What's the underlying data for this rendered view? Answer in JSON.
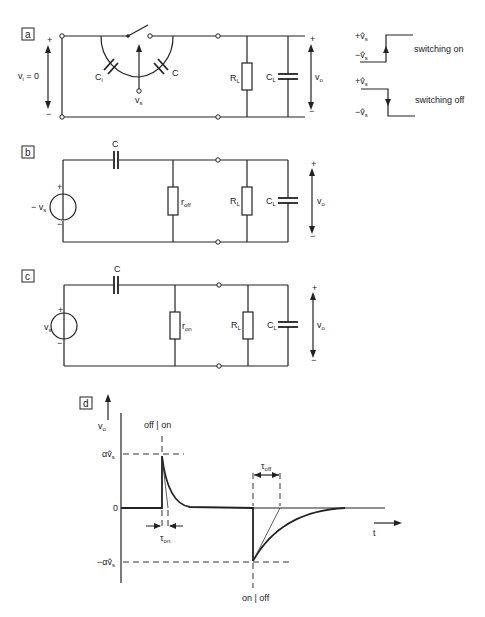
{
  "panels": {
    "a": {
      "tag": "a",
      "vi_label": "v",
      "vi_sub": "i",
      "vi_eq": " = 0",
      "ci_label": "C",
      "ci_sub": "i",
      "c_label": "C",
      "vs_label": "v",
      "vs_sub": "s",
      "rl_label": "R",
      "rl_sub": "L",
      "cl_label": "C",
      "cl_sub": "L",
      "vo_label": "v",
      "vo_sub": "o",
      "plus": "+",
      "minus": "−",
      "switching_on": {
        "label": "switching on",
        "top": "+v̂",
        "top_sub": "s",
        "bottom": "−v̂",
        "bottom_sub": "s"
      },
      "switching_off": {
        "label": "switching off",
        "top": "+v̂",
        "top_sub": "s",
        "bottom": "−v̂",
        "bottom_sub": "s"
      }
    },
    "b": {
      "tag": "b",
      "source_label": "− v",
      "source_sub": "s",
      "c_label": "C",
      "r_label": "r",
      "r_sub": "off",
      "rl_label": "R",
      "rl_sub": "L",
      "cl_label": "C",
      "cl_sub": "L",
      "vo_label": "v",
      "vo_sub": "o",
      "plus": "+",
      "minus": "−"
    },
    "c": {
      "tag": "c",
      "source_label": "v",
      "source_sub": "s",
      "c_label": "C",
      "r_label": "r",
      "r_sub": "on",
      "rl_label": "R",
      "rl_sub": "L",
      "cl_label": "C",
      "cl_sub": "L",
      "vo_label": "v",
      "vo_sub": "o",
      "plus": "+",
      "minus": "−"
    },
    "d": {
      "tag": "d",
      "y_axis_label": "v",
      "y_axis_sub": "o",
      "x_axis_label": "t",
      "off_on": "off | on",
      "on_off": "on | off",
      "pos_peak": "αv̂",
      "pos_peak_sub": "s",
      "neg_peak": "−αv̂",
      "neg_peak_sub": "s",
      "zero": "0",
      "tau_on": "τ",
      "tau_on_sub": "on",
      "tau_off": "τ",
      "tau_off_sub": "off"
    }
  }
}
